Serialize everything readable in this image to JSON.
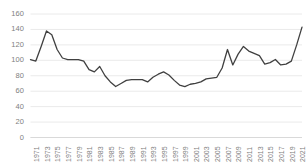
{
  "chart_data": {
    "type": "line",
    "title": "",
    "subtitle": "",
    "xlabel": "",
    "ylabel": "",
    "ylim": [
      0,
      160
    ],
    "yticks": [
      0,
      20,
      40,
      60,
      80,
      100,
      120,
      140,
      160
    ],
    "grid": true,
    "legend": false,
    "legend_position": "none",
    "line_color": "#404040",
    "gridline_color": "#eaeaea",
    "axis_color": "#d9d9d9",
    "tick_label_color": "#808080",
    "x": [
      1971,
      1972,
      1973,
      1974,
      1975,
      1976,
      1977,
      1978,
      1979,
      1980,
      1981,
      1982,
      1983,
      1984,
      1985,
      1986,
      1987,
      1988,
      1989,
      1990,
      1991,
      1992,
      1993,
      1994,
      1995,
      1996,
      1997,
      1998,
      1999,
      2000,
      2001,
      2002,
      2003,
      2004,
      2005,
      2006,
      2007,
      2008,
      2009,
      2010,
      2011,
      2012,
      2013,
      2014,
      2015,
      2016,
      2017,
      2018,
      2019,
      2020,
      2021,
      2022
    ],
    "values": [
      101,
      99,
      118,
      138,
      133,
      114,
      103,
      101,
      101,
      101,
      99,
      88,
      85,
      92,
      80,
      72,
      66,
      70,
      74,
      75,
      75,
      75,
      72,
      78,
      82,
      85,
      81,
      74,
      68,
      66,
      69,
      70,
      72,
      76,
      77,
      78,
      90,
      114,
      94,
      108,
      118,
      112,
      109,
      106,
      95,
      97,
      101,
      94,
      95,
      99,
      120,
      143
    ],
    "xtick_labels": [
      "1971",
      "1973",
      "1975",
      "1977",
      "1979",
      "1981",
      "1983",
      "1985",
      "1987",
      "1989",
      "1991",
      "1993",
      "1995",
      "1997",
      "1999",
      "2001",
      "2003",
      "2005",
      "2007",
      "2009",
      "2011",
      "2013",
      "2015",
      "2017",
      "2019",
      "2021"
    ]
  }
}
